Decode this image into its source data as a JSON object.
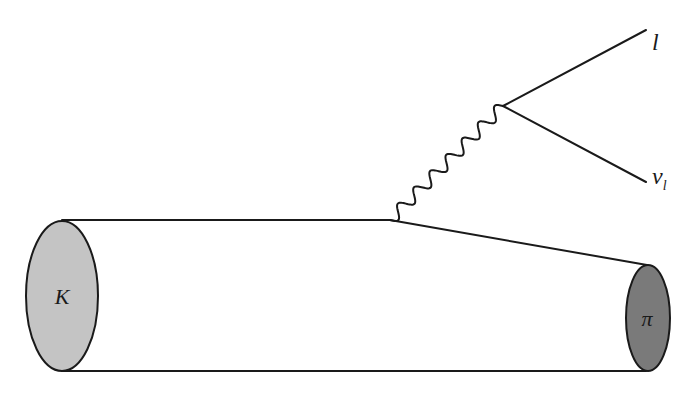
{
  "diagram": {
    "particles": {
      "initial": {
        "label": "K",
        "fill": "#c4c4c4"
      },
      "final": {
        "label": "π",
        "fill": "#7a7a7a"
      },
      "lepton": {
        "label": "l"
      },
      "neutrino": {
        "label": "ν",
        "subscript": "l"
      }
    },
    "boson": {
      "style": "wavy",
      "oscillations": 7
    },
    "colors": {
      "stroke": "#1a1a1a",
      "background": "#ffffff"
    }
  }
}
